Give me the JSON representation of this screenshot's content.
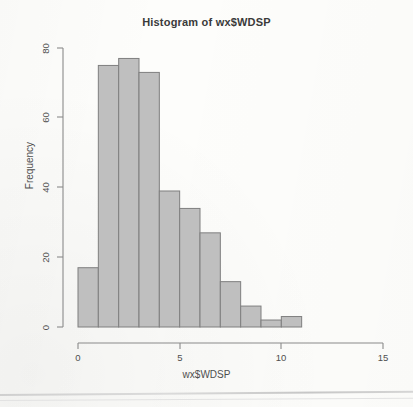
{
  "chart_data": {
    "type": "bar",
    "subtype": "histogram",
    "title": "Histogram of wx$WDSP",
    "xlabel": "wx$WDSP",
    "ylabel": "Frequency",
    "xlim": [
      0,
      15
    ],
    "ylim": [
      0,
      80
    ],
    "xticks": [
      0,
      5,
      10,
      15
    ],
    "xtick_labels": [
      "0",
      "5",
      "10",
      "15"
    ],
    "yticks": [
      0,
      20,
      40,
      60,
      80
    ],
    "ytick_labels": [
      "0",
      "20",
      "40",
      "60",
      "80"
    ],
    "grid": false,
    "legend": null,
    "bin_width": 1,
    "bin_edges": [
      0,
      1,
      2,
      3,
      4,
      5,
      6,
      7,
      8,
      9,
      10,
      11
    ],
    "categories": [
      "0-1",
      "1-2",
      "2-3",
      "3-4",
      "4-5",
      "5-6",
      "6-7",
      "7-8",
      "8-9",
      "9-10",
      "10-11"
    ],
    "values": [
      17,
      75,
      77,
      73,
      39,
      34,
      27,
      13,
      6,
      2,
      3
    ],
    "bar_fill_color": "#bfbfbf",
    "bar_border_color": "#7f7f7f",
    "axis_color": "#8a8a8a",
    "background_color": "#fdfdfb"
  },
  "annotations": {
    "scan_artifact": "page-edge-line"
  }
}
